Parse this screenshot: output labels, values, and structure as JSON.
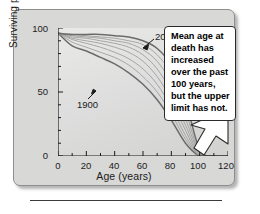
{
  "chart_data": {
    "type": "line",
    "title": "",
    "xlabel": "Age (years)",
    "ylabel": "Surviving population (%)",
    "xlim": [
      0,
      120
    ],
    "ylim": [
      0,
      100
    ],
    "xticks": [
      0,
      20,
      40,
      60,
      80,
      100,
      120
    ],
    "yticks": [
      0,
      50,
      100
    ],
    "xtick_labels": [
      "0",
      "20",
      "40",
      "60",
      "80",
      "100",
      "120"
    ],
    "ytick_labels": [
      "0",
      "50",
      "100"
    ],
    "minor_xtick_step": 10,
    "minor_ytick_step": 10,
    "grid": false,
    "legend": "none",
    "annotations": [
      {
        "name": "2000",
        "label": "2000",
        "points_to_curve": "2000",
        "arrow": "down-left"
      },
      {
        "name": "1900",
        "label": "1900",
        "points_to_curve": "1900",
        "arrow": "up-left"
      }
    ],
    "x": [
      0,
      10,
      20,
      30,
      40,
      50,
      60,
      70,
      80,
      90,
      100,
      110,
      120
    ],
    "series": [
      {
        "name": "1900",
        "values": [
          96,
          86,
          82,
          77,
          72,
          65,
          56,
          44,
          28,
          10,
          0,
          0,
          0
        ]
      },
      {
        "name": "1914",
        "values": [
          96,
          89,
          85,
          81,
          77,
          71,
          62,
          50,
          33,
          13,
          0,
          0,
          0
        ]
      },
      {
        "name": "1928",
        "values": [
          96,
          91,
          88,
          85,
          81,
          76,
          68,
          56,
          38,
          16,
          0,
          0,
          0
        ]
      },
      {
        "name": "1942",
        "values": [
          96,
          92,
          90,
          88,
          85,
          81,
          74,
          62,
          44,
          20,
          0,
          0,
          0
        ]
      },
      {
        "name": "1956",
        "values": [
          96,
          93,
          92,
          90,
          88,
          85,
          79,
          68,
          50,
          24,
          1,
          0,
          0
        ]
      },
      {
        "name": "1970",
        "values": [
          96,
          94,
          93,
          92,
          90,
          88,
          83,
          74,
          57,
          29,
          2,
          0,
          0
        ]
      },
      {
        "name": "1984",
        "values": [
          96,
          95,
          94,
          93,
          92,
          90,
          87,
          79,
          64,
          35,
          3,
          0,
          0
        ]
      },
      {
        "name": "2000",
        "values": [
          96,
          95,
          95,
          95,
          94,
          93,
          90,
          84,
          71,
          43,
          5,
          0,
          0
        ]
      }
    ]
  },
  "callout": {
    "name": "mean-age-callout",
    "text": "Mean age at death has increased over the past 100 years, but the upper limit has not.",
    "arrow_direction": "down-left",
    "arrow_target": "100 years on x-axis"
  },
  "colors": {
    "panel_background": "#d8d8d6",
    "plot_background": "#e2e2e0",
    "axis": "#1b1b1b",
    "curve_extreme": "#6b6b6b",
    "curve_inner": "#9a9a98",
    "callout_background": "#ffffff",
    "callout_border": "#2b2b2b",
    "text": "#1b1b1b"
  }
}
